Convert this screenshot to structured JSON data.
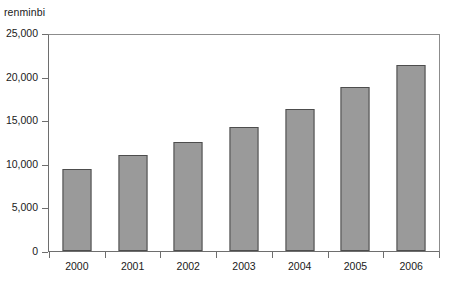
{
  "chart_data": {
    "type": "bar",
    "title": "",
    "subtitle": "",
    "xlabel": "",
    "ylabel": "renminbi",
    "unit_caption": "renminbi",
    "categories": [
      "2000",
      "2001",
      "2002",
      "2003",
      "2004",
      "2005",
      "2006"
    ],
    "values": [
      9400,
      11000,
      12500,
      14200,
      16300,
      18800,
      21300
    ],
    "series": [
      {
        "name": "renminbi",
        "values": [
          9400,
          11000,
          12500,
          14200,
          16300,
          18800,
          21300
        ]
      }
    ],
    "ylim": [
      0,
      25000
    ],
    "ytick_labels": [
      "0",
      "5,000",
      "10,000",
      "15,000",
      "20,000",
      "25,000"
    ],
    "ytick_values": [
      0,
      5000,
      10000,
      15000,
      20000,
      25000
    ],
    "grid": false,
    "legend": null,
    "legend_position": "none",
    "annotations": [],
    "bar_fill_color": "#9a9a9a",
    "bar_border_color": "#4d4d4d",
    "axis_color": "#6e6e6e",
    "background_color": "#ffffff"
  }
}
